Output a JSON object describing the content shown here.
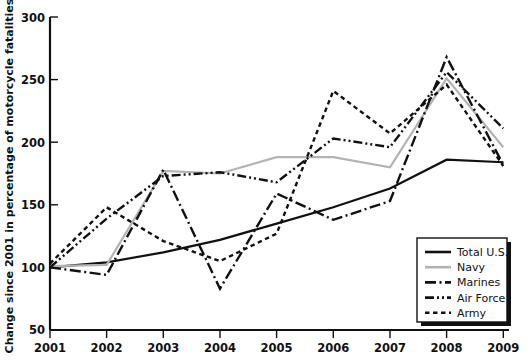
{
  "chart_data": {
    "type": "line",
    "title": "",
    "subtitle": "",
    "xlabel": "",
    "ylabel": "Change since 2001 in percentage of motorcycle fatalities",
    "x": [
      2001,
      2002,
      2003,
      2004,
      2005,
      2006,
      2007,
      2008,
      2009
    ],
    "xtick_labels": [
      "2001",
      "2002",
      "2003",
      "2004",
      "2005",
      "2006",
      "2007",
      "2008",
      "2009"
    ],
    "ytick_labels": [
      "50",
      "100",
      "150",
      "200",
      "250",
      "300"
    ],
    "ytick_values": [
      50,
      100,
      150,
      200,
      250,
      300
    ],
    "xlim": [
      2001,
      2009
    ],
    "ylim": [
      50,
      300
    ],
    "grid": false,
    "legend_position": "bottom-right",
    "series": [
      {
        "name": "Total U.S.",
        "style": "solid",
        "color": "#111111",
        "values": [
          100,
          104,
          112,
          122,
          135,
          148,
          163,
          186,
          184
        ]
      },
      {
        "name": "Navy",
        "style": "solid",
        "color": "#b3b3b3",
        "values": [
          101,
          102,
          177,
          175,
          188,
          188,
          180,
          251,
          196
        ]
      },
      {
        "name": "Marines",
        "style": "dash-dot",
        "color": "#111111",
        "values": [
          100,
          94,
          178,
          83,
          159,
          138,
          153,
          268,
          182
        ]
      },
      {
        "name": "Air Force",
        "style": "dash-dot-dot",
        "color": "#111111",
        "values": [
          100,
          139,
          173,
          176,
          168,
          203,
          196,
          256,
          211
        ]
      },
      {
        "name": "Army",
        "style": "dotted",
        "color": "#111111",
        "values": [
          103,
          148,
          121,
          105,
          127,
          241,
          207,
          246,
          181
        ]
      }
    ]
  },
  "legend": {
    "items": [
      {
        "label": "Total U.S."
      },
      {
        "label": "Navy"
      },
      {
        "label": "Marines"
      },
      {
        "label": "Air Force"
      },
      {
        "label": "Army"
      }
    ]
  }
}
